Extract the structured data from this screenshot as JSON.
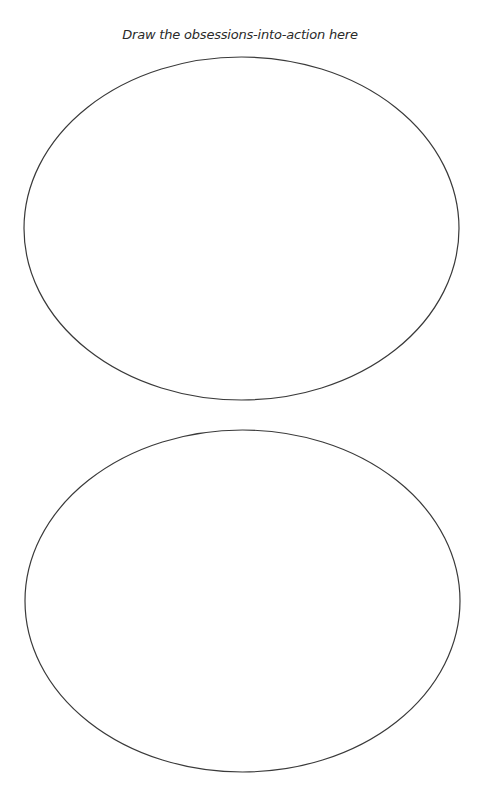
{
  "worksheet": {
    "title": "Draw the obsessions-into-action here",
    "drawing_areas": [
      {
        "id": "top",
        "shape": "ellipse",
        "cx": 241.5,
        "cy": 228.5,
        "rx": 217.5,
        "ry": 171.5
      },
      {
        "id": "bottom",
        "shape": "ellipse",
        "cx": 242.5,
        "cy": 601,
        "rx": 217.5,
        "ry": 171
      }
    ],
    "stroke_color": "#3a3a3a",
    "background_color": "#ffffff"
  }
}
